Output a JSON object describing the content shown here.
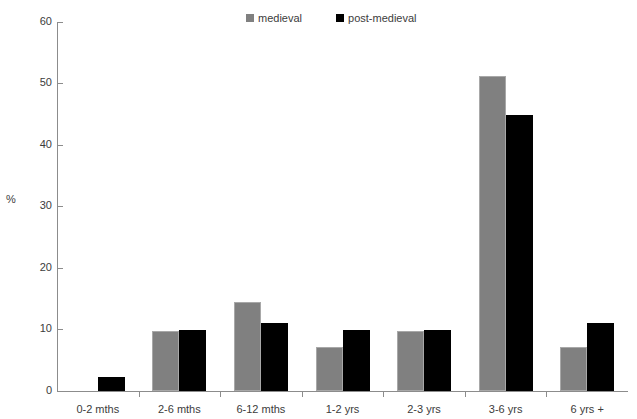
{
  "chart_data": {
    "type": "bar",
    "title": "",
    "xlabel": "",
    "ylabel": "%",
    "ylim": [
      0,
      60
    ],
    "yticks": [
      0,
      10,
      20,
      30,
      40,
      50,
      60
    ],
    "grid": false,
    "legend_position": "top-center",
    "categories": [
      "0-2 mths",
      "2-6 mths",
      "6-12 mths",
      "1-2 yrs",
      "2-3 yrs",
      "3-6 yrs",
      "6 yrs +"
    ],
    "series": [
      {
        "name": "medieval",
        "color": "#808080",
        "values": [
          0,
          9.7,
          14.5,
          7.2,
          9.7,
          51.2,
          7.1
        ]
      },
      {
        "name": "post-medieval",
        "color": "#000000",
        "values": [
          2.2,
          10.0,
          11.1,
          10.0,
          10.0,
          44.8,
          11.0
        ]
      }
    ]
  },
  "legend": {
    "entries": [
      {
        "label": "medieval",
        "swatch": "medieval-swatch"
      },
      {
        "label": "post-medieval",
        "swatch": "post-medieval-swatch"
      }
    ]
  },
  "axes": {
    "y_label": "%",
    "y_ticks": [
      "60",
      "50",
      "40",
      "30",
      "20",
      "10",
      "0"
    ],
    "x_labels": [
      "0-2 mths",
      "2-6 mths",
      "6-12 mths",
      "1-2 yrs",
      "2-3 yrs",
      "3-6 yrs",
      "6 yrs +"
    ]
  },
  "colors": {
    "medieval": "#808080",
    "post_medieval": "#000000",
    "axis": "#8c8c8c",
    "text": "#3c3c3c",
    "background": "#ffffff"
  }
}
